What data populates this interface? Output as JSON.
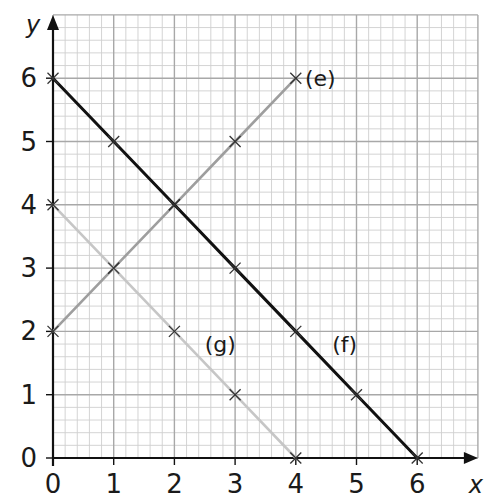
{
  "chart_data": {
    "type": "line",
    "title": "",
    "xlabel": "x",
    "ylabel": "y",
    "xlim": [
      0,
      7
    ],
    "ylim": [
      0,
      7
    ],
    "grid": true,
    "grid_minor_step": 0.2,
    "x_ticks": [
      "0",
      "1",
      "2",
      "3",
      "4",
      "5",
      "6"
    ],
    "y_ticks": [
      "0",
      "1",
      "2",
      "3",
      "4",
      "5",
      "6"
    ],
    "legend": "inline labels",
    "series": [
      {
        "name": "(e)",
        "color": "#9e9e9e",
        "points": [
          [
            0,
            2
          ],
          [
            1,
            3
          ],
          [
            2,
            4
          ],
          [
            3,
            5
          ],
          [
            4,
            6
          ]
        ],
        "label_pos": [
          4.15,
          6
        ]
      },
      {
        "name": "(f)",
        "color": "#111111",
        "points": [
          [
            0,
            6
          ],
          [
            1,
            5
          ],
          [
            2,
            4
          ],
          [
            3,
            3
          ],
          [
            4,
            2
          ],
          [
            5,
            1
          ],
          [
            6,
            0
          ]
        ],
        "label_pos": [
          4.6,
          1.8
        ]
      },
      {
        "name": "(g)",
        "color": "#c6c6c6",
        "points": [
          [
            0,
            4
          ],
          [
            1,
            3
          ],
          [
            2,
            2
          ],
          [
            3,
            1
          ],
          [
            4,
            0
          ]
        ],
        "label_pos": [
          2.5,
          1.8
        ]
      }
    ]
  },
  "colors": {
    "background": "#ffffff",
    "grid_major": "#a8a8a8",
    "grid_minor": "#cfcfcf",
    "axis": "#111111",
    "marker": "#333333"
  }
}
